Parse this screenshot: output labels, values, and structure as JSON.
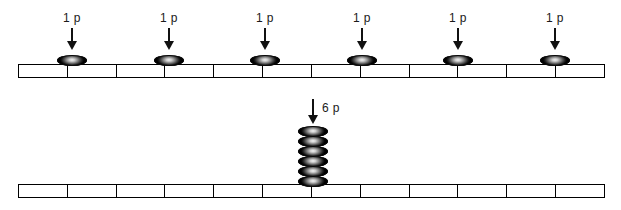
{
  "diagram": {
    "width": 621,
    "height": 210,
    "background_color": "#ffffff",
    "ink_color": "#000000"
  },
  "rows": [
    {
      "id": "row-one-penny-coins",
      "description": "Twelve-segment bar with six single 1p coins placed on alternating segment boundaries",
      "bar": {
        "segments": 12,
        "x": 18,
        "y": 64,
        "width": 587,
        "height": 14
      },
      "markers": [
        {
          "label": "1 p",
          "value": 1,
          "unit": "p",
          "coins": 1,
          "x": 72,
          "label_x": 72,
          "label_y": 11,
          "arrow_y": 28,
          "arrow_height": 22,
          "coin_y": 55
        },
        {
          "label": "1 p",
          "value": 1,
          "unit": "p",
          "coins": 1,
          "x": 169,
          "label_x": 169,
          "label_y": 11,
          "arrow_y": 28,
          "arrow_height": 22,
          "coin_y": 55
        },
        {
          "label": "1 p",
          "value": 1,
          "unit": "p",
          "coins": 1,
          "x": 265,
          "label_x": 265,
          "label_y": 11,
          "arrow_y": 28,
          "arrow_height": 22,
          "coin_y": 55
        },
        {
          "label": "1 p",
          "value": 1,
          "unit": "p",
          "coins": 1,
          "x": 362,
          "label_x": 362,
          "label_y": 11,
          "arrow_y": 28,
          "arrow_height": 22,
          "coin_y": 55
        },
        {
          "label": "1 p",
          "value": 1,
          "unit": "p",
          "coins": 1,
          "x": 458,
          "label_x": 458,
          "label_y": 11,
          "arrow_y": 28,
          "arrow_height": 22,
          "coin_y": 55
        },
        {
          "label": "1 p",
          "value": 1,
          "unit": "p",
          "coins": 1,
          "x": 555,
          "label_x": 555,
          "label_y": 11,
          "arrow_y": 28,
          "arrow_height": 22,
          "coin_y": 55
        }
      ]
    },
    {
      "id": "row-six-penny-stack",
      "description": "Twelve-segment bar with one stack of six coins labelled 6 p",
      "bar": {
        "segments": 12,
        "x": 18,
        "y": 184,
        "width": 587,
        "height": 14
      },
      "markers": [
        {
          "label": "6 p",
          "value": 6,
          "unit": "p",
          "coins": 6,
          "x": 313,
          "label_x": 322,
          "label_y": 101,
          "arrow_y": 99,
          "arrow_height": 25,
          "coin_y": 175,
          "stack_top": 126,
          "coin_pitch": 10
        }
      ]
    }
  ],
  "legend": {
    "coin_label_one": "1 p",
    "coin_label_six": "6 p"
  }
}
